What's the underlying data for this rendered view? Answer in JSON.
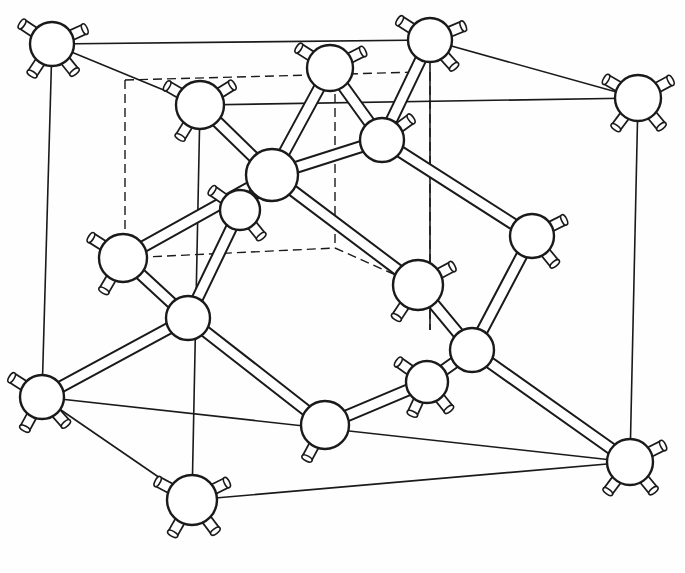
{
  "figure": {
    "title": "",
    "caption": "",
    "colors": {
      "line": "#1a1a1a",
      "background": "#fefefe",
      "atom_fill": "#ffffff"
    }
  },
  "cube": {
    "solid_edges": [
      [
        52,
        44,
        430,
        40
      ],
      [
        430,
        40,
        638,
        98
      ],
      [
        52,
        44,
        200,
        105
      ],
      [
        52,
        44,
        42,
        397
      ],
      [
        638,
        98,
        630,
        462
      ],
      [
        42,
        397,
        192,
        500
      ],
      [
        192,
        500,
        630,
        462
      ],
      [
        200,
        105,
        638,
        98
      ],
      [
        200,
        105,
        192,
        500
      ],
      [
        430,
        40,
        430,
        330
      ],
      [
        42,
        397,
        630,
        462
      ]
    ],
    "hidden_edges": [
      [
        125,
        80,
        420,
        72
      ],
      [
        125,
        80,
        125,
        258
      ],
      [
        125,
        258,
        335,
        248
      ],
      [
        335,
        80,
        335,
        248
      ],
      [
        335,
        248,
        418,
        285
      ],
      [
        430,
        72,
        430,
        330
      ]
    ]
  },
  "atoms": [
    {
      "id": "a1",
      "x": 52,
      "y": 44,
      "r": 22,
      "stubs": [
        [
          -24,
          -16
        ],
        [
          22,
          -10
        ],
        [
          -16,
          24
        ],
        [
          16,
          20
        ]
      ]
    },
    {
      "id": "a2",
      "x": 430,
      "y": 40,
      "r": 22,
      "stubs": [
        [
          -22,
          -14
        ],
        [
          24,
          -10
        ],
        [
          18,
          20
        ]
      ]
    },
    {
      "id": "a3",
      "x": 638,
      "y": 98,
      "r": 23,
      "stubs": [
        [
          -24,
          -14
        ],
        [
          26,
          -14
        ],
        [
          -18,
          24
        ],
        [
          18,
          22
        ]
      ]
    },
    {
      "id": "a4",
      "x": 200,
      "y": 105,
      "r": 24,
      "stubs": [
        [
          -24,
          -14
        ],
        [
          26,
          -16
        ],
        [
          -16,
          26
        ]
      ]
    },
    {
      "id": "a5",
      "x": 330,
      "y": 68,
      "r": 23,
      "stubs": [
        [
          -22,
          -14
        ],
        [
          24,
          -12
        ]
      ]
    },
    {
      "id": "a6",
      "x": 382,
      "y": 140,
      "r": 22,
      "stubs": [
        [
          22,
          -16
        ]
      ]
    },
    {
      "id": "a7",
      "x": 272,
      "y": 175,
      "r": 26,
      "stubs": []
    },
    {
      "id": "a8",
      "x": 240,
      "y": 210,
      "r": 20,
      "stubs": [
        [
          -20,
          -14
        ],
        [
          16,
          20
        ]
      ]
    },
    {
      "id": "a9",
      "x": 123,
      "y": 258,
      "r": 24,
      "stubs": [
        [
          -22,
          -14
        ],
        [
          -14,
          24
        ]
      ]
    },
    {
      "id": "a10",
      "x": 188,
      "y": 318,
      "r": 22,
      "stubs": []
    },
    {
      "id": "a11",
      "x": 532,
      "y": 236,
      "r": 22,
      "stubs": [
        [
          24,
          -12
        ],
        [
          18,
          22
        ]
      ]
    },
    {
      "id": "a12",
      "x": 418,
      "y": 285,
      "r": 25,
      "stubs": [
        [
          26,
          -14
        ],
        [
          -16,
          24
        ]
      ]
    },
    {
      "id": "a13",
      "x": 472,
      "y": 350,
      "r": 22,
      "stubs": []
    },
    {
      "id": "a14",
      "x": 427,
      "y": 382,
      "r": 21,
      "stubs": [
        [
          -20,
          -14
        ],
        [
          -12,
          26
        ],
        [
          16,
          20
        ]
      ]
    },
    {
      "id": "a15",
      "x": 325,
      "y": 425,
      "r": 24,
      "stubs": [
        [
          -14,
          26
        ]
      ]
    },
    {
      "id": "a16",
      "x": 42,
      "y": 397,
      "r": 22,
      "stubs": [
        [
          -22,
          -14
        ],
        [
          -12,
          22
        ],
        [
          16,
          18
        ]
      ]
    },
    {
      "id": "a17",
      "x": 192,
      "y": 500,
      "r": 25,
      "stubs": [
        [
          -26,
          -14
        ],
        [
          28,
          -14
        ],
        [
          -16,
          28
        ],
        [
          18,
          24
        ]
      ]
    },
    {
      "id": "a18",
      "x": 630,
      "y": 462,
      "r": 23,
      "stubs": [
        [
          28,
          -14
        ],
        [
          -18,
          24
        ],
        [
          18,
          22
        ]
      ]
    }
  ],
  "bonds": [
    [
      "a4",
      "a7"
    ],
    [
      "a5",
      "a7"
    ],
    [
      "a7",
      "a9"
    ],
    [
      "a7",
      "a12"
    ],
    [
      "a2",
      "a6"
    ],
    [
      "a5",
      "a6"
    ],
    [
      "a6",
      "a11"
    ],
    [
      "a6",
      "a7"
    ],
    [
      "a8",
      "a10"
    ],
    [
      "a9",
      "a10"
    ],
    [
      "a10",
      "a15"
    ],
    [
      "a11",
      "a13"
    ],
    [
      "a12",
      "a13"
    ],
    [
      "a13",
      "a18"
    ],
    [
      "a13",
      "a14"
    ],
    [
      "a14",
      "a15"
    ],
    [
      "a10",
      "a16"
    ],
    [
      "a8",
      "a7"
    ]
  ]
}
